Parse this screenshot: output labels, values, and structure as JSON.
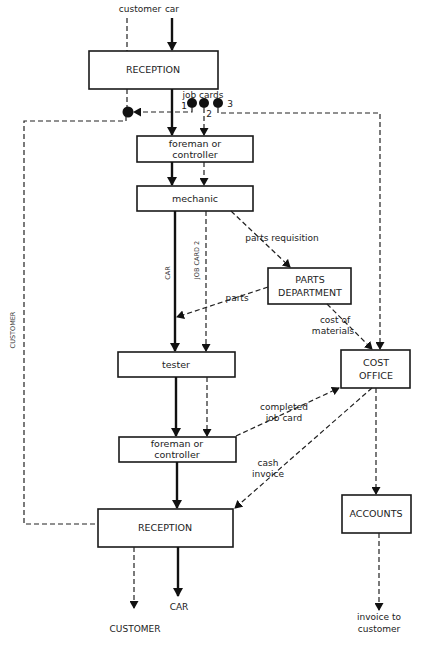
{
  "diagram": {
    "type": "flowchart",
    "title": "",
    "nodes": {
      "reception_top": {
        "label": "RECEPTION"
      },
      "foreman_1": {
        "line1": "foreman or",
        "line2": "controller"
      },
      "mechanic": {
        "label": "mechanic"
      },
      "parts_department": {
        "line1": "PARTS",
        "line2": "DEPARTMENT"
      },
      "tester": {
        "label": "tester"
      },
      "cost_office": {
        "line1": "COST",
        "line2": "OFFICE"
      },
      "foreman_2": {
        "line1": "foreman or",
        "line2": "controller"
      },
      "reception_bottom": {
        "label": "RECEPTION"
      },
      "accounts": {
        "label": "ACCOUNTS"
      }
    },
    "inputs": {
      "customer": "customer",
      "car": "car"
    },
    "job_cards": {
      "label": "job cards",
      "card1": "1",
      "card2": "2",
      "card3": "3"
    },
    "edge_labels": {
      "parts_requisition": "parts requisition",
      "parts": "parts",
      "cost_of_materials_1": "cost of",
      "cost_of_materials_2": "materials",
      "completed_job_card_1": "completed",
      "completed_job_card_2": "job card",
      "cash_invoice_1": "cash",
      "cash_invoice_2": "invoice",
      "car_vertical": "CAR",
      "job_card_2_vertical": "JOB CARD 2",
      "customer_vertical": "CUSTOMER"
    },
    "outputs": {
      "customer": "CUSTOMER",
      "car": "CAR",
      "invoice_1": "invoice to",
      "invoice_2": "customer"
    },
    "legend": {
      "solid_line": "car flow",
      "dashed_line": "document / customer flow"
    }
  }
}
